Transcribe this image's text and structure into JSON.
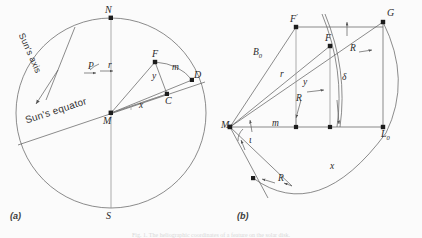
{
  "figure": {
    "background_color": "#fbfbfb",
    "stroke_color": "#555555",
    "caption": "Fig. 1.  The heliographic coordinates of a feature on the solar disk."
  },
  "panels": [
    {
      "id": "a",
      "label": "(a)",
      "description": "Apparent solar disk with rotation axis and equator",
      "text_labels": [
        {
          "name": "suns-axis",
          "text": "Sun's axis"
        },
        {
          "name": "suns-equator",
          "text": "Sun's equator"
        }
      ],
      "points": [
        {
          "name": "north-pole",
          "text": "N"
        },
        {
          "name": "south-pole",
          "text": "S"
        },
        {
          "name": "disk-centre",
          "text": "M"
        },
        {
          "name": "feature",
          "text": "F"
        },
        {
          "name": "foot-point",
          "text": "C"
        },
        {
          "name": "limb-point",
          "text": "D"
        }
      ],
      "variables": [
        {
          "name": "position-angle-p",
          "text": "P"
        },
        {
          "name": "radius-r",
          "text": "r"
        },
        {
          "name": "arc-m",
          "text": "m"
        },
        {
          "name": "coord-x",
          "text": "x"
        },
        {
          "name": "coord-y",
          "text": "y"
        }
      ]
    },
    {
      "id": "b",
      "label": "(b)",
      "description": "Cross-section construction for heliographic latitude and longitude",
      "points": [
        {
          "name": "centre-m",
          "text": "M"
        },
        {
          "name": "feature-f-prime",
          "text": "F",
          "prime": "'"
        },
        {
          "name": "feature-f",
          "text": "F"
        },
        {
          "name": "point-g",
          "text": "G"
        },
        {
          "name": "point-l",
          "text": "L",
          "sub": "0"
        }
      ],
      "variables": [
        {
          "name": "solar-b-zero",
          "text": "B",
          "sub": "0"
        },
        {
          "name": "radius-r-lower",
          "text": "r"
        },
        {
          "name": "coord-y",
          "text": "y"
        },
        {
          "name": "delta",
          "text": "δ"
        },
        {
          "name": "radius-R-upper-right",
          "text": "R"
        },
        {
          "name": "radius-R-mid",
          "text": "R"
        },
        {
          "name": "radius-R-lower",
          "text": "R"
        },
        {
          "name": "arc-m",
          "text": "m"
        },
        {
          "name": "coord-x",
          "text": "x"
        },
        {
          "name": "angle-iota",
          "text": "ι"
        }
      ]
    }
  ]
}
